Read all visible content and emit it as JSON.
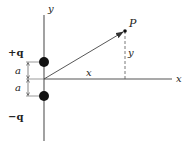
{
  "diagram": {
    "type": "electric-dipole-field-point",
    "axes": {
      "x_label": "x",
      "y_label": "y"
    },
    "charges": [
      {
        "label": "+q",
        "position": "above origin",
        "offset": "a"
      },
      {
        "label": "−q",
        "position": "below origin",
        "offset": "a"
      }
    ],
    "dimension_labels": {
      "upper_a": "a",
      "lower_a": "a"
    },
    "point": {
      "label": "P",
      "x_distance_label": "x",
      "y_distance_label": "y"
    },
    "colors": {
      "line": "#555555",
      "charge": "#111111",
      "background": "#ffffff"
    }
  }
}
